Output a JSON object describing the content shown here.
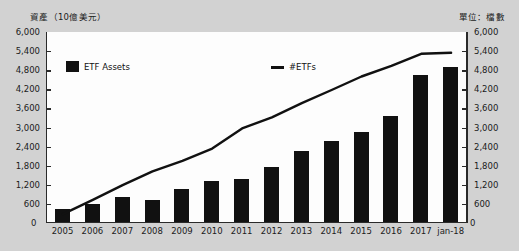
{
  "header": {
    "left_unit_label": "資產（10億美元）",
    "right_unit_label": "單位：檔數"
  },
  "legend": {
    "bars_label": "ETF Assets",
    "line_label": "#ETFs"
  },
  "axis": {
    "zero_left": "0",
    "zero_right": "0"
  },
  "chart_data": {
    "type": "bar",
    "title": "",
    "subtitle": "",
    "xlabel": "",
    "ylabel": "資產（10億美元）",
    "y2label": "單位：檔數",
    "categories": [
      "2005",
      "2006",
      "2007",
      "2008",
      "2009",
      "2010",
      "2011",
      "2012",
      "2013",
      "2014",
      "2015",
      "2016",
      "2017",
      "jan-18"
    ],
    "ylim": [
      0,
      6000
    ],
    "y2lim": [
      0,
      6000
    ],
    "yticks": [
      "0",
      "600",
      "1,200",
      "1,800",
      "2,400",
      "3,000",
      "3,600",
      "4,200",
      "4,800",
      "5,400",
      "6,000"
    ],
    "y2ticks": [
      "0",
      "600",
      "1,200",
      "1,800",
      "2,400",
      "3,000",
      "3,600",
      "4,200",
      "4,800",
      "5,400",
      "6,000"
    ],
    "grid": false,
    "legend_position": "top-inside",
    "series": [
      {
        "name": "ETF Assets",
        "type": "bar",
        "axis": "left",
        "color": "#111111",
        "values": [
          400,
          560,
          800,
          710,
          1040,
          1300,
          1350,
          1750,
          2250,
          2550,
          2850,
          3350,
          4650,
          4900
        ]
      },
      {
        "name": "#ETFs",
        "type": "line",
        "axis": "right",
        "color": "#111111",
        "values": [
          250,
          700,
          1170,
          1610,
          1940,
          2330,
          2970,
          3320,
          3770,
          4190,
          4620,
          4960,
          5340,
          5370
        ]
      }
    ]
  }
}
